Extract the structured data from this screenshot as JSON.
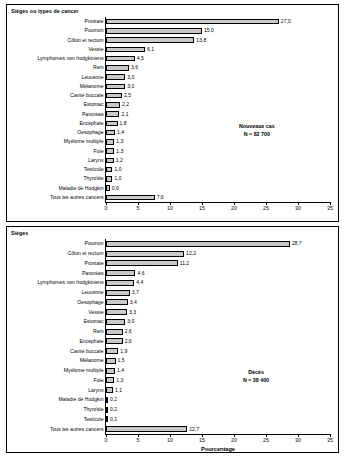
{
  "chart_data": [
    {
      "type": "bar",
      "title": "Sièges ou types de cancer",
      "xlabel": "",
      "ylabel": "",
      "orientation": "horizontal",
      "xlim": [
        0,
        35
      ],
      "xticks": [
        0,
        5,
        10,
        15,
        20,
        25,
        30,
        35
      ],
      "grid": false,
      "annotation": "Nouveaux cas\nN = 82 700",
      "annotation_lines": [
        "Nouveaux cas",
        "N = 82 700"
      ],
      "categories": [
        "Prostate",
        "Poumon",
        "Côlon et rectum",
        "Vessie",
        "Lymphomes non hodgkiniens",
        "Rein",
        "Leucémie",
        "Mélanome",
        "Cavité buccale",
        "Estomac",
        "Pancréas",
        "Encéphale",
        "Oesophage",
        "Myélome multiple",
        "Foie",
        "Larynx",
        "Testicule",
        "Thyroïde",
        "Maladie de Hodgkin",
        "Tous les autres cancers"
      ],
      "values": [
        27.0,
        15.0,
        13.8,
        6.1,
        4.5,
        3.6,
        3.0,
        3.0,
        2.5,
        2.2,
        2.1,
        1.8,
        1.4,
        1.3,
        1.3,
        1.2,
        1.0,
        1.0,
        0.6,
        7.6
      ],
      "value_labels": [
        "27,0",
        "15,0",
        "13,8",
        "6,1",
        "4,5",
        "3,6",
        "3,0",
        "3,0",
        "2,5",
        "2,2",
        "2,1",
        "1,8",
        "1,4",
        "1,3",
        "1,3",
        "1,2",
        "1,0",
        "1,0",
        "0,6",
        "7,6"
      ]
    },
    {
      "type": "bar",
      "title": "Sièges",
      "xlabel": "Pourcentage",
      "ylabel": "",
      "orientation": "horizontal",
      "xlim": [
        0,
        35
      ],
      "xticks": [
        0,
        5,
        10,
        15,
        20,
        25,
        30,
        35
      ],
      "grid": false,
      "annotation": "Décès\nN = 38 400",
      "annotation_lines": [
        "Décès",
        "N = 38 400"
      ],
      "categories": [
        "Poumon",
        "Côlon et rectum",
        "Prostate",
        "Pancréas",
        "Lymphomes non hodgkiniens",
        "Leucémie",
        "Oesophage",
        "Vessie",
        "Estomac",
        "Rein",
        "Encéphale",
        "Cavité buccale",
        "Mélanome",
        "Myélome multiple",
        "Foie",
        "Larynx",
        "Maladie de Hodgkin",
        "Thyroïde",
        "Testicule",
        "Tous les autres cancers"
      ],
      "values": [
        28.7,
        12.2,
        11.2,
        4.6,
        4.4,
        3.7,
        3.4,
        3.3,
        3.0,
        2.6,
        2.6,
        1.9,
        1.5,
        1.4,
        1.3,
        1.1,
        0.2,
        0.2,
        0.1,
        12.7
      ],
      "value_labels": [
        "28,7",
        "12,2",
        "11,2",
        "4,6",
        "4,4",
        "3,7",
        "3,4",
        "3,3",
        "3,0",
        "2,6",
        "2,6",
        "1,9",
        "1,5",
        "1,4",
        "1,3",
        "1,1",
        "0,2",
        "0,2",
        "0,1",
        "12,7"
      ]
    }
  ],
  "style": {
    "bar_fill": "#c9c9c9",
    "bar_stroke": "#000000",
    "axis_color": "#000000",
    "background": "#ffffff"
  }
}
